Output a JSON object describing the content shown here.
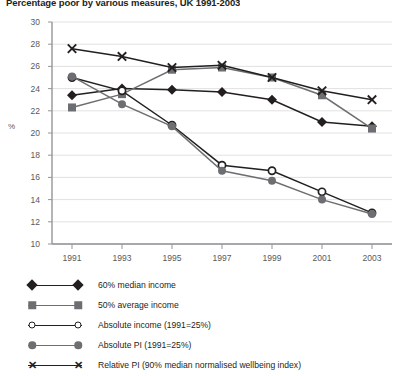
{
  "chart_data": {
    "type": "line",
    "title": "Percentage poor by various measures, UK 1991-2003",
    "xlabel": "",
    "ylabel": "%",
    "ylim": [
      10,
      30
    ],
    "ytick_step": 2,
    "yticks": [
      10,
      12,
      14,
      16,
      18,
      20,
      22,
      24,
      26,
      28,
      30
    ],
    "x": [
      1991,
      1993,
      1995,
      1997,
      1999,
      2001,
      2003
    ],
    "xticks": [
      "1991",
      "1993",
      "1995",
      "1997",
      "1999",
      "2001",
      "2003"
    ],
    "grid": true,
    "legend_position": "below",
    "series": [
      {
        "name": "60% median income",
        "marker": "filled-diamond",
        "color": "#231f20",
        "values": [
          23.4,
          24.0,
          23.9,
          23.7,
          23.0,
          21.0,
          20.6
        ]
      },
      {
        "name": "50% average income",
        "marker": "filled-square",
        "color": "#6d6e71",
        "values": [
          22.3,
          23.5,
          25.7,
          25.9,
          25.0,
          23.4,
          20.4
        ]
      },
      {
        "name": "Absolute income (1991=25%)",
        "marker": "open-circle",
        "color": "#231f20",
        "values": [
          25.0,
          23.8,
          20.7,
          17.1,
          16.6,
          14.7,
          12.8
        ]
      },
      {
        "name": "Absolute PI (1991=25%)",
        "marker": "filled-circle",
        "color": "#6d6e71",
        "values": [
          25.1,
          22.6,
          20.6,
          16.6,
          15.7,
          14.0,
          12.7
        ]
      },
      {
        "name": "Relative PI (90% median normalised wellbeing index)",
        "marker": "x-cross",
        "color": "#231f20",
        "values": [
          27.6,
          26.9,
          25.9,
          26.1,
          25.0,
          23.8,
          23.0
        ]
      }
    ]
  },
  "legend": {
    "items": [
      {
        "label": "60% median income",
        "marker": "filled-diamond"
      },
      {
        "label": "50% average income",
        "marker": "filled-square"
      },
      {
        "label": "Absolute income (1991=25%)",
        "marker": "open-circle"
      },
      {
        "label": "Absolute PI (1991=25%)",
        "marker": "filled-circle"
      },
      {
        "label": "Relative PI (90% median normalised wellbeing index)",
        "marker": "x-cross"
      }
    ]
  }
}
